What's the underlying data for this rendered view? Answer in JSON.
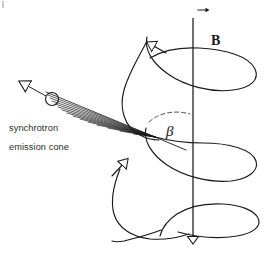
{
  "figure": {
    "width": 267,
    "height": 264,
    "background_color": "#ffffff",
    "stroke_color": "#1a1a1a",
    "text_color": "#2a2a2a"
  },
  "labels": {
    "caption_line1": "synchrotron",
    "caption_line2": "emission cone",
    "magnetic_field": "B",
    "angle": "β"
  },
  "elements": {
    "axis_name": "magnetic-field-axis",
    "helix_name": "electron-helical-trajectory",
    "cone_name": "synchrotron-emission-cone",
    "electron_name": "electron-particle",
    "angle_arc_name": "pitch-angle-arc"
  },
  "geometry": {
    "axis_x": 193,
    "axis_top_y": 18,
    "axis_bottom_y": 252,
    "helix_center_x": 193,
    "helix_radius_x": 62,
    "helix_radius_y": 11,
    "helix_top_y": 62,
    "helix_bottom_y": 240,
    "cone_apex_x": 155,
    "cone_apex_y": 137,
    "electron_x": 52,
    "electron_y": 99,
    "electron_radius": 6.5,
    "velocity_arrow_tip_x": 20,
    "velocity_arrow_tip_y": 82
  }
}
